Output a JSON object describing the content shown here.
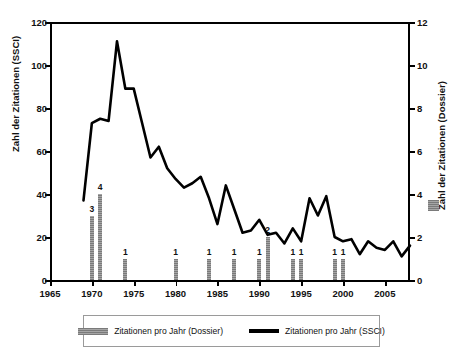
{
  "chart_data": {
    "type": "line",
    "title": "",
    "xlabel": "",
    "ylabel": "Zahl der Zitationen (SSCI)",
    "ylabel_right": "Zahl der Zitationen (Dossier)",
    "xlim": [
      1965,
      2008
    ],
    "ylim": [
      0,
      120
    ],
    "ylim_right": [
      0,
      12
    ],
    "xticks": [
      1965,
      1970,
      1975,
      1980,
      1985,
      1990,
      1995,
      2000,
      2005
    ],
    "yticks": [
      0,
      20,
      40,
      60,
      80,
      100,
      120
    ],
    "yticks_right": [
      0,
      2,
      4,
      6,
      8,
      10,
      12
    ],
    "grid": false,
    "legend_position": "bottom",
    "series": [
      {
        "name": "Zitationen pro Jahr (Dossier)",
        "type": "bar",
        "axis": "right",
        "color": "#8f8f8f",
        "x": [
          1970,
          1971,
          1974,
          1980,
          1984,
          1987,
          1990,
          1991,
          1994,
          1995,
          1999,
          2000
        ],
        "values": [
          3,
          4,
          1,
          1,
          1,
          1,
          1,
          2,
          1,
          1,
          1,
          1
        ],
        "point_labels": [
          "3",
          "4",
          "1",
          "1",
          "1",
          "1",
          "1",
          "2",
          "1",
          "1",
          "1",
          "1"
        ]
      },
      {
        "name": "Zitationen pro Jahr (SSCI)",
        "type": "line",
        "axis": "left",
        "color": "#000000",
        "x": [
          1969,
          1970,
          1971,
          1972,
          1973,
          1974,
          1975,
          1976,
          1977,
          1978,
          1979,
          1980,
          1981,
          1982,
          1983,
          1984,
          1985,
          1986,
          1987,
          1988,
          1989,
          1990,
          1991,
          1992,
          1993,
          1994,
          1995,
          1996,
          1997,
          1998,
          1999,
          2000,
          2001,
          2002,
          2003,
          2004,
          2005,
          2006,
          2007,
          2008
        ],
        "values": [
          37,
          73,
          75,
          74,
          111,
          89,
          89,
          73,
          57,
          62,
          52,
          47,
          43,
          45,
          48,
          38,
          26,
          44,
          33,
          22,
          23,
          28,
          21,
          22,
          17,
          24,
          18,
          38,
          30,
          39,
          20,
          18,
          19,
          12,
          18,
          15,
          14,
          18,
          11,
          16
        ]
      }
    ]
  },
  "axes": {
    "left_title": "Zahl der Zitationen (SSCI)",
    "right_title": "Zahl der Zitationen (Dossier)"
  },
  "legend": {
    "items": [
      {
        "label": "Zitationen pro Jahr (Dossier)",
        "marker": "bar-swatch"
      },
      {
        "label": "Zitationen pro Jahr (SSCI)",
        "marker": "line-swatch"
      }
    ]
  }
}
